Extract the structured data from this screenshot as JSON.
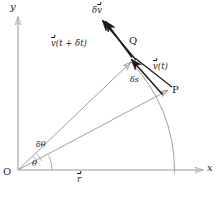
{
  "figure": {
    "kind": "vector-diagram",
    "background_color": "#ffffff",
    "line_color": "#8a8a8a",
    "bold_line_color": "#1c1c1c",
    "text_color": "#1c1c1c"
  },
  "axes": {
    "x_label": "x",
    "y_label": "y",
    "origin_label": "O"
  },
  "points": {
    "p_label": "P",
    "q_label": "Q"
  },
  "angles": {
    "theta": "θ",
    "delta_theta_prefix": "δ",
    "delta_theta_symbol": "θ"
  },
  "vectors": {
    "r_prefix": "r",
    "v_t": "v",
    "v_t_arg": "(t)",
    "v_t_plus_dt": "v",
    "v_t_plus_dt_arg": "(t + δt)",
    "delta_v_prefix": "δ",
    "delta_v_symbol": "v",
    "delta_s_prefix": "δ",
    "delta_s_symbol": "s"
  },
  "geometry": {
    "origin": [
      18,
      170
    ],
    "point_p": [
      172,
      87
    ],
    "point_q": [
      135,
      58
    ],
    "arc_radius": 176,
    "theta_deg": 28,
    "delta_theta_deg": 12
  }
}
